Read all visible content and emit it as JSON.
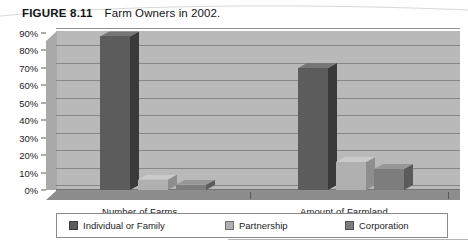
{
  "figure": {
    "number": "FIGURE 8.11",
    "title": "Farm Owners in 2002."
  },
  "colors": {
    "individual": "#5c5c5c",
    "partnership": "#b0b0b0",
    "corporation": "#7d7d7d",
    "plot_background": "#b9b9b9",
    "gridline": "#7e7e7e",
    "floor": "#8d8d8d",
    "text": "#1c1c1c"
  },
  "legend": {
    "items": [
      {
        "label": "Individual or Family",
        "color": "#5c5c5c"
      },
      {
        "label": "Partnership",
        "color": "#b0b0b0"
      },
      {
        "label": "Corporation",
        "color": "#7d7d7d"
      }
    ]
  },
  "axis": {
    "y_ticks": [
      "90%",
      "80%",
      "70%",
      "60%",
      "50%",
      "40%",
      "30%",
      "20%",
      "10%",
      "0%"
    ],
    "x_categories": [
      "Number of Farms",
      "Amount of Farmland"
    ]
  },
  "source_note": "",
  "chart_data": {
    "type": "bar",
    "title": "Farm Owners in 2002.",
    "xlabel": "",
    "ylabel": "",
    "ylim": [
      0,
      90
    ],
    "ytick_step": 10,
    "ytick_format": "percent",
    "grid": true,
    "legend_position": "bottom",
    "three_d": true,
    "categories": [
      "Number of Farms",
      "Amount of Farmland"
    ],
    "series": [
      {
        "name": "Individual or Family",
        "color": "#5c5c5c",
        "values": [
          88,
          70
        ]
      },
      {
        "name": "Partnership",
        "color": "#b0b0b0",
        "values": [
          6,
          16
        ]
      },
      {
        "name": "Corporation",
        "color": "#7d7d7d",
        "values": [
          3,
          12
        ]
      }
    ]
  }
}
